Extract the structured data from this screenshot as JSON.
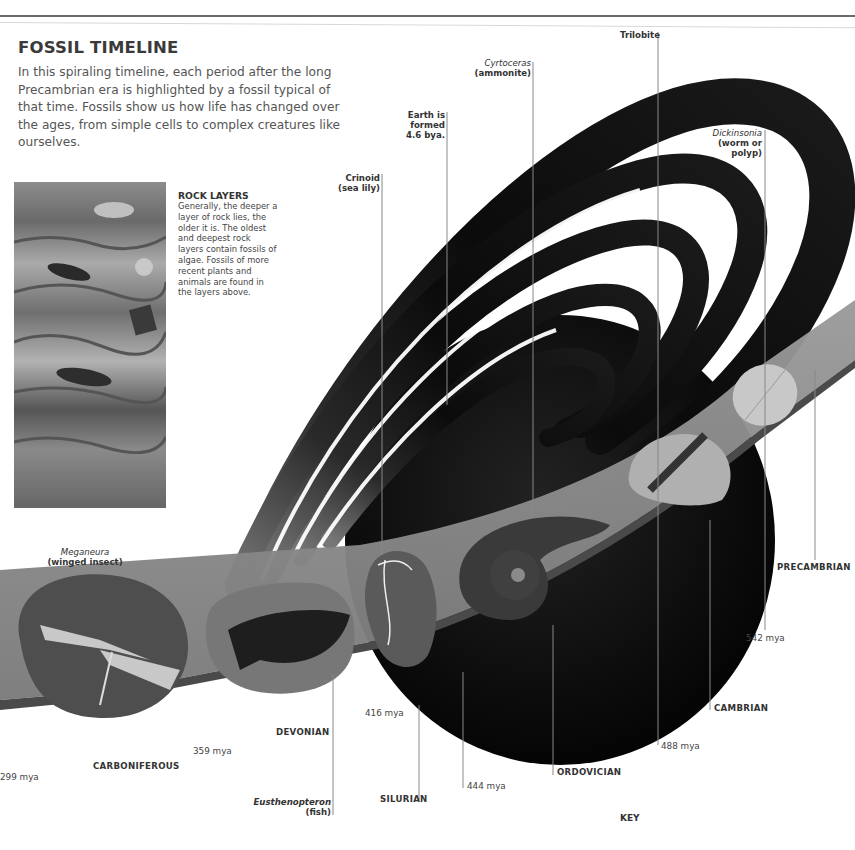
{
  "header": {
    "title": "FOSSIL TIMELINE",
    "intro": "In this spiraling timeline, each period after the long Precambrian era is highlighted by a fossil typical of that time. Fossils show us how life has changed over the ages, from simple cells to complex creatures like ourselves."
  },
  "rock_layers": {
    "title": "ROCK LAYERS",
    "text": "Generally, the deeper a layer of rock lies, the older it is. The oldest and deepest rock layers contain fossils of algae. Fossils of more recent plants and animals are found in the layers above."
  },
  "fossil_labels": {
    "trilobite": "Trilobite",
    "cyrtoceras_name": "Cyrtoceras",
    "cyrtoceras_desc": "(ammonite)",
    "earth_line1": "Earth is",
    "earth_line2": "formed",
    "earth_line3": "4.6 bya.",
    "crinoid_line1": "Crinoid",
    "crinoid_line2": "(sea lily)",
    "dickinsonia_name": "Dickinsonia",
    "dickinsonia_desc1": "(worm or",
    "dickinsonia_desc2": "polyp)",
    "meganeura_name": "Meganeura",
    "meganeura_desc": "(winged insect)",
    "eusthenopteron_name": "Eusthenopteron",
    "eusthenopteron_desc": "(fish)"
  },
  "periods": {
    "precambrian": "PRECAMBRIAN",
    "cambrian": "CAMBRIAN",
    "ordovician": "ORDOVICIAN",
    "silurian": "SILURIAN",
    "devonian": "DEVONIAN",
    "carboniferous": "CARBONIFEROUS"
  },
  "dates": {
    "d542": "542 mya",
    "d488": "488 mya",
    "d444": "444 mya",
    "d416": "416 mya",
    "d359": "359 mya",
    "d299": "299 mya"
  },
  "footer": {
    "key": "KEY"
  },
  "colors": {
    "band": "#8a8a8a",
    "spiral": "#111111",
    "earth": "#0c0c0c"
  }
}
